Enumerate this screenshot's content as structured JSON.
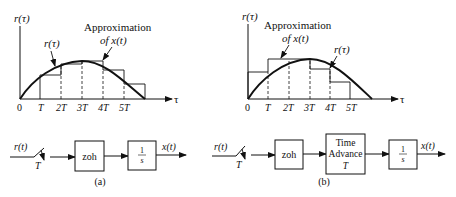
{
  "panel_a": {
    "y_label": "r(τ)",
    "x_label": "τ",
    "curve_label": "r(τ)",
    "approx_label_1": "Approximation",
    "approx_label_2": "of x(t)",
    "ticks": [
      "0",
      "T",
      "2T",
      "3T",
      "4T",
      "5T"
    ],
    "caption": "(a)",
    "block": {
      "input": "r(t)",
      "sample": "T",
      "zoh": "zoh",
      "integrator_num": "1",
      "integrator_den": "s",
      "output": "x(t)"
    }
  },
  "panel_b": {
    "y_label": "r(τ)",
    "x_label": "τ",
    "curve_label": "r(τ)",
    "approx_label_1": "Approximation",
    "approx_label_2": "of x(t)",
    "ticks": [
      "0",
      "T",
      "2T",
      "3T",
      "4T",
      "5T"
    ],
    "caption": "(b)",
    "block": {
      "input": "r(t)",
      "sample": "T",
      "zoh": "zoh",
      "advance_1": "Time",
      "advance_2": "Advance",
      "advance_3": "T",
      "integrator_num": "1",
      "integrator_den": "s",
      "output": "x(t)"
    }
  }
}
